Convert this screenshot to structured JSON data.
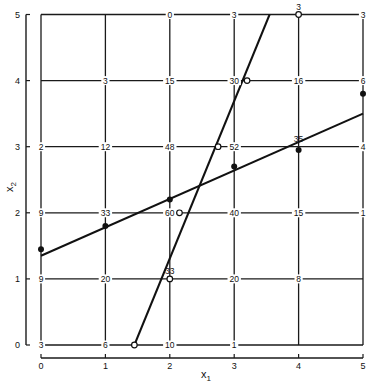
{
  "chart_data": {
    "type": "scatter",
    "title": "",
    "xlabel": "x1",
    "ylabel": "x2",
    "xlim": [
      0,
      5
    ],
    "ylim": [
      0,
      5
    ],
    "x_ticks": [
      "0",
      "1",
      "2",
      "3",
      "4",
      "5"
    ],
    "y_ticks": [
      "0",
      "1",
      "2",
      "3",
      "4",
      "5"
    ],
    "grid": true,
    "grid_node_labels": [
      {
        "x": 2,
        "y": 5,
        "label": "0"
      },
      {
        "x": 3,
        "y": 5,
        "label": "3"
      },
      {
        "x": 4,
        "y": 5,
        "label": "3"
      },
      {
        "x": 5,
        "y": 5,
        "label": "3"
      },
      {
        "x": 1,
        "y": 4,
        "label": "3"
      },
      {
        "x": 2,
        "y": 4,
        "label": "15"
      },
      {
        "x": 3,
        "y": 4,
        "label": "30"
      },
      {
        "x": 4,
        "y": 4,
        "label": "16"
      },
      {
        "x": 5,
        "y": 4,
        "label": "6"
      },
      {
        "x": 0,
        "y": 3,
        "label": "2"
      },
      {
        "x": 1,
        "y": 3,
        "label": "12"
      },
      {
        "x": 2,
        "y": 3,
        "label": "48"
      },
      {
        "x": 3,
        "y": 3,
        "label": "52"
      },
      {
        "x": 4,
        "y": 3,
        "label": "35"
      },
      {
        "x": 5,
        "y": 3,
        "label": "4"
      },
      {
        "x": 0,
        "y": 2,
        "label": "9"
      },
      {
        "x": 1,
        "y": 2,
        "label": "33"
      },
      {
        "x": 2,
        "y": 2,
        "label": "60"
      },
      {
        "x": 3,
        "y": 2,
        "label": "40"
      },
      {
        "x": 4,
        "y": 2,
        "label": "15"
      },
      {
        "x": 5,
        "y": 2,
        "label": "1"
      },
      {
        "x": 0,
        "y": 1,
        "label": "9"
      },
      {
        "x": 1,
        "y": 1,
        "label": "20"
      },
      {
        "x": 2,
        "y": 1,
        "label": "33"
      },
      {
        "x": 3,
        "y": 1,
        "label": "20"
      },
      {
        "x": 4,
        "y": 1,
        "label": "8"
      },
      {
        "x": 0,
        "y": 0,
        "label": "3"
      },
      {
        "x": 1,
        "y": 0,
        "label": "6"
      },
      {
        "x": 2,
        "y": 0,
        "label": "10"
      },
      {
        "x": 3,
        "y": 0,
        "label": "1"
      }
    ],
    "series": [
      {
        "name": "filled-points",
        "marker": "filled-circle",
        "points": [
          [
            0,
            1.45
          ],
          [
            1,
            1.8
          ],
          [
            2,
            2.2
          ],
          [
            3,
            2.7
          ],
          [
            4,
            2.95
          ],
          [
            5,
            3.8
          ]
        ]
      },
      {
        "name": "open-points",
        "marker": "open-circle",
        "points": [
          [
            1.45,
            0
          ],
          [
            2,
            1
          ],
          [
            2.15,
            2
          ],
          [
            2.75,
            3
          ],
          [
            3.2,
            4
          ],
          [
            4,
            5
          ]
        ]
      },
      {
        "name": "shallow-fit-line",
        "marker": "line",
        "points": [
          [
            0,
            1.35
          ],
          [
            5,
            3.5
          ]
        ]
      },
      {
        "name": "steep-fit-line",
        "marker": "line",
        "points": [
          [
            1.45,
            0
          ],
          [
            3.55,
            5
          ]
        ]
      }
    ]
  },
  "axes": {
    "x_label": "x",
    "x_label_sub": "1",
    "y_label": "x",
    "y_label_sub": "2"
  }
}
